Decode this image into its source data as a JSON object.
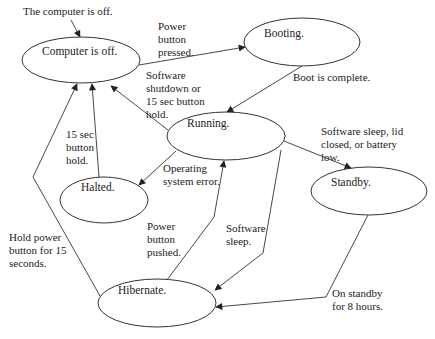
{
  "diagram": {
    "type": "state-diagram",
    "initial_label": "The computer is off.",
    "states": [
      {
        "id": "off",
        "label": "Computer is off.",
        "cx": 81,
        "cy": 60,
        "rx": 59,
        "ry": 23
      },
      {
        "id": "booting",
        "label": "Booting.",
        "cx": 302,
        "cy": 42,
        "rx": 58,
        "ry": 24
      },
      {
        "id": "running",
        "label": "Running.",
        "cx": 226,
        "cy": 136,
        "rx": 59,
        "ry": 24
      },
      {
        "id": "halted",
        "label": "Halted.",
        "cx": 104,
        "cy": 200,
        "rx": 44,
        "ry": 23
      },
      {
        "id": "standby",
        "label": "Standby.",
        "cx": 369,
        "cy": 191,
        "rx": 58,
        "ry": 24
      },
      {
        "id": "hibernate",
        "label": "Hibernate.",
        "cx": 157,
        "cy": 303,
        "rx": 59,
        "ry": 24
      }
    ],
    "transitions": [
      {
        "from": "off",
        "to": "booting",
        "label": "Power\nbutton\npressed."
      },
      {
        "from": "booting",
        "to": "running",
        "label": "Boot is complete."
      },
      {
        "from": "running",
        "to": "off",
        "label": "Software\nshutdown or\n15 sec button\nhold."
      },
      {
        "from": "halted",
        "to": "off",
        "label": "15 sec\nbutton\nhold."
      },
      {
        "from": "running",
        "to": "halted",
        "label": "Operating\nsystem error."
      },
      {
        "from": "running",
        "to": "standby",
        "label": "Software sleep, lid\nclosed, or battery\nlow."
      },
      {
        "from": "hibernate",
        "to": "off",
        "label": "Hold power\nbutton for 15\nseconds."
      },
      {
        "from": "hibernate",
        "to": "running",
        "label": "Power\nbutton\npushed."
      },
      {
        "from": "running",
        "to": "hibernate",
        "label": "Software\nsleep."
      },
      {
        "from": "standby",
        "to": "hibernate",
        "label": "On standby\nfor 8 hours."
      }
    ]
  }
}
